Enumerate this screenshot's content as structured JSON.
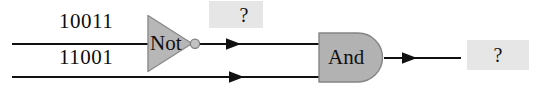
{
  "figure": {
    "type": "logic-circuit-diagram",
    "background_color": "#ffffff",
    "wire_color": "#111111",
    "gate_fill_color": "#b5b5b5",
    "gate_stroke_color": "#6e6e6e",
    "highlight_box_color": "#e6e6e6"
  },
  "inputs": [
    {
      "id": "input-top",
      "label": "10011",
      "wire_y": 44
    },
    {
      "id": "input-bottom",
      "label": "11001",
      "wire_y": 77
    }
  ],
  "gates": [
    {
      "id": "not-gate",
      "label": "Not",
      "type": "NOT",
      "inverted": true
    },
    {
      "id": "and-gate",
      "label": "And",
      "type": "AND",
      "inverted": false
    }
  ],
  "outputs": [
    {
      "id": "not-output",
      "label": "?"
    },
    {
      "id": "and-output",
      "label": "?"
    }
  ],
  "icons": {
    "arrowhead": "arrow-right-icon",
    "inversion_bubble": "inversion-bubble-icon"
  }
}
